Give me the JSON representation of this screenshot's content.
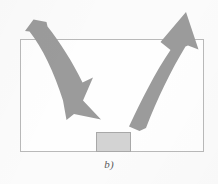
{
  "figure": {
    "caption": "b)",
    "background_color": "#fbfbfb",
    "box": {
      "name": "container-rectangle",
      "x": 20,
      "y": 39,
      "width": 183,
      "height": 113,
      "stroke_color": "#b9b9b9",
      "fill_color": "#fefefe",
      "stroke_width": 1
    },
    "block": {
      "name": "bottom-block",
      "label": "",
      "x": 96,
      "y": 132,
      "width": 34,
      "height": 20,
      "fill_color": "#d3d3d3",
      "stroke_color": "#a8a8a8"
    },
    "arrows": [
      {
        "name": "left-downward-curved-arrow",
        "direction": "down-right",
        "fill_color": "#9b9b9b",
        "tail_x": 33,
        "tail_y": 20,
        "tip_x": 101,
        "tip_y": 119
      },
      {
        "name": "right-upward-curved-arrow",
        "direction": "up",
        "fill_color": "#9b9b9b",
        "tail_x": 139,
        "tail_y": 131,
        "tip_x": 186,
        "tip_y": 12
      }
    ]
  }
}
